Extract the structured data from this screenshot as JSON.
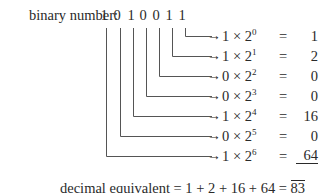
{
  "label": "binary number:",
  "digits": [
    "1",
    "0",
    "1",
    "0",
    "0",
    "1",
    "1"
  ],
  "arrow_glyph": "→",
  "rows": [
    {
      "coef": "1",
      "times": "×",
      "base": "2",
      "exp": "0",
      "eq": "=",
      "value": "1"
    },
    {
      "coef": "1",
      "times": "×",
      "base": "2",
      "exp": "1",
      "eq": "=",
      "value": "2"
    },
    {
      "coef": "0",
      "times": "×",
      "base": "2",
      "exp": "2",
      "eq": "=",
      "value": "0"
    },
    {
      "coef": "0",
      "times": "×",
      "base": "2",
      "exp": "3",
      "eq": "=",
      "value": "0"
    },
    {
      "coef": "1",
      "times": "×",
      "base": "2",
      "exp": "4",
      "eq": "=",
      "value": "16"
    },
    {
      "coef": "0",
      "times": "×",
      "base": "2",
      "exp": "5",
      "eq": "=",
      "value": "0"
    },
    {
      "coef": "1",
      "times": "×",
      "base": "2",
      "exp": "6",
      "eq": "=",
      "value": "64"
    }
  ],
  "sum": {
    "label": "decimal equivalent",
    "expression": "= 1 + 2 + 16 + 64 =",
    "total": "83"
  }
}
